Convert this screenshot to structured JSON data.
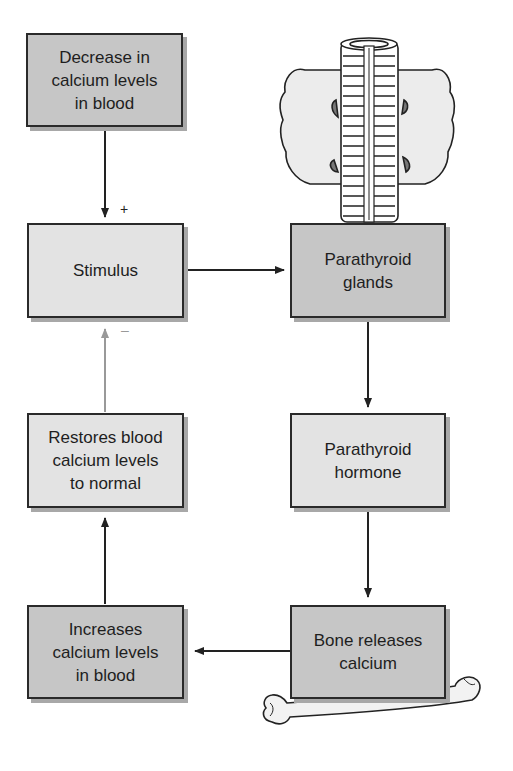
{
  "diagram": {
    "boxes": {
      "decrease": "Decrease in\ncalcium levels\nin blood",
      "stimulus": "Stimulus",
      "restores": "Restores blood\ncalcium levels\nto normal",
      "increases": "Increases\ncalcium levels\nin blood",
      "glands": "Parathyroid\nglands",
      "hormone": "Parathyroid\nhormone",
      "bone": "Bone releases\ncalcium"
    },
    "signs": {
      "positive": "+",
      "negative": "–"
    },
    "colors": {
      "dark_box": "#c6c6c6",
      "light_box": "#e3e3e3",
      "arrow": "#222222",
      "feedback_arrow": "#999999"
    }
  }
}
